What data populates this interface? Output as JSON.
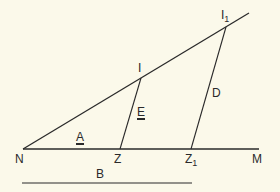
{
  "diagram": {
    "colors": {
      "background": "#fbf9ea",
      "stroke": "#2a2a2a"
    },
    "points": {
      "N": {
        "x": 23,
        "y": 149
      },
      "M": {
        "x": 259,
        "y": 149
      },
      "Z": {
        "x": 120,
        "y": 149
      },
      "Z1": {
        "x": 191,
        "y": 149
      },
      "I": {
        "x": 141,
        "y": 78
      },
      "I1": {
        "x": 226,
        "y": 27
      },
      "ray_end": {
        "x": 249,
        "y": 13
      },
      "B_start": {
        "x": 22,
        "y": 183
      },
      "B_end": {
        "x": 192,
        "y": 183
      }
    },
    "labels": {
      "N": "N",
      "Z": "Z",
      "Z1_base": "Z",
      "Z1_sub": "1",
      "M": "M",
      "I": "I",
      "I1_base": "I",
      "I1_sub": "1",
      "A": "A",
      "E": "E",
      "D": "D",
      "B": "B"
    },
    "segments": [
      {
        "name": "base-line-NM",
        "from": "N",
        "to": "M"
      },
      {
        "name": "slanted-line-N-ray",
        "from": "N",
        "to": "ray_end"
      },
      {
        "name": "segment-ZI-E",
        "from": "Z",
        "to": "I"
      },
      {
        "name": "segment-Z1I1-D",
        "from": "Z1",
        "to": "I1"
      },
      {
        "name": "segment-B",
        "from": "B_start",
        "to": "B_end"
      }
    ]
  }
}
